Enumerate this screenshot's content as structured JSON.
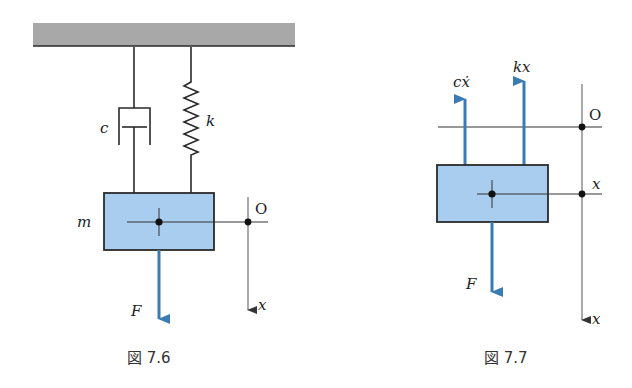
{
  "colors": {
    "mass_fill": "#a9cdee",
    "mass_stroke": "#2a2a2a",
    "ceiling_fill": "#a8a8a8",
    "force_arrow": "#3b7bb3",
    "line": "#2a2a2a",
    "axis": "#555555"
  },
  "figure_7_6": {
    "caption": "図 7.6",
    "labels": {
      "damper": "c",
      "spring": "k",
      "mass": "m",
      "origin": "O",
      "axis": "x",
      "force": "F"
    }
  },
  "figure_7_7": {
    "caption": "図 7.7",
    "labels": {
      "damper_force": "cẋ",
      "spring_force": "kx",
      "origin": "O",
      "displacement": "x",
      "axis": "x",
      "force": "F"
    }
  }
}
